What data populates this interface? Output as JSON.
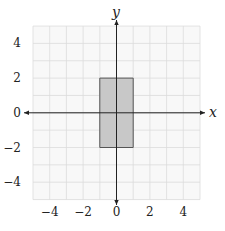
{
  "chart_data": {
    "type": "diagram-coordinate-plane",
    "title": "",
    "xlabel": "x",
    "ylabel": "y",
    "xlim": [
      -5,
      5
    ],
    "ylim": [
      -5,
      5
    ],
    "grid": true,
    "grid_step": 1,
    "x_ticks": [
      -4,
      -2,
      0,
      2,
      4
    ],
    "y_ticks": [
      4,
      2,
      0,
      -2,
      -4
    ],
    "x_tick_labels": [
      "−4",
      "−2",
      "0",
      "2",
      "4"
    ],
    "y_tick_labels": [
      "4",
      "2",
      "0",
      "−2",
      "−4"
    ],
    "shapes": [
      {
        "type": "rectangle",
        "vertices": [
          [
            -1,
            2
          ],
          [
            1,
            2
          ],
          [
            1,
            -2
          ],
          [
            -1,
            -2
          ]
        ],
        "fill": "#c8c8c8",
        "stroke": "#555555"
      }
    ]
  },
  "colors": {
    "grid": "#dcdcdc",
    "grid_bg": "#f7f7f7",
    "axis": "#222222",
    "rect_fill": "#c8c8c8",
    "rect_stroke": "#555555"
  }
}
